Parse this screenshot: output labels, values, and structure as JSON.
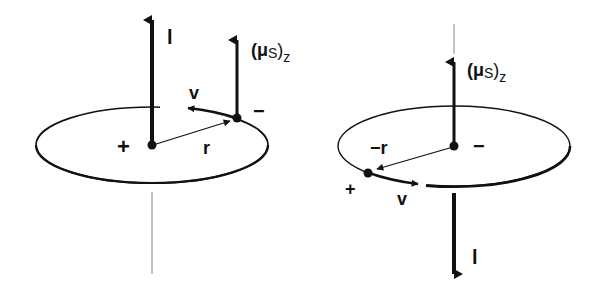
{
  "diagram": {
    "left_panel": {
      "labels": {
        "l": "l",
        "mu": "(μ",
        "mu_sub": "S",
        "mu_close": ")",
        "mu_z": "z",
        "v": "v",
        "r": "r",
        "plus": "+",
        "minus": "−"
      },
      "center_charge": "+",
      "orbiting_charge": "−"
    },
    "right_panel": {
      "labels": {
        "l": "l",
        "mu": "(μ",
        "mu_sub": "S",
        "mu_close": ")",
        "mu_z": "z",
        "v": "v",
        "r": "−r",
        "plus": "+",
        "minus": "−"
      },
      "center_charge": "−",
      "orbiting_charge": "+"
    },
    "colors": {
      "ink": "#111111",
      "background": "#ffffff",
      "axis_line": "#777777"
    }
  }
}
